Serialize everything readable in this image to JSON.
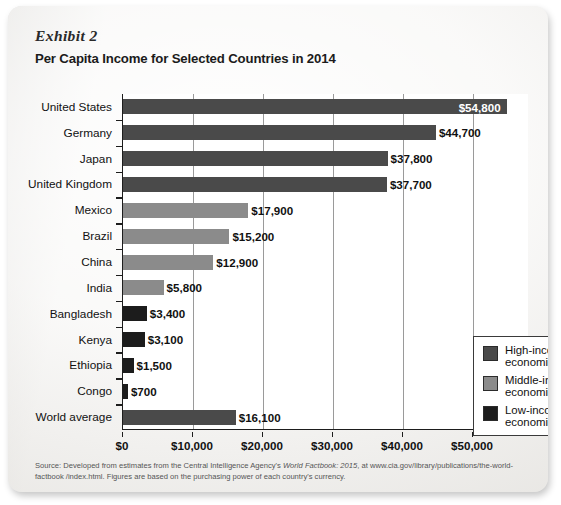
{
  "exhibit_label": "Exhibit 2",
  "title": "Per Capita Income for Selected Countries in 2014",
  "source_note_part1": "Source: Developed from estimates from the Central Intelligence Agency's ",
  "source_note_italic": "World Factbook: 2015",
  "source_note_part2": ", at www.cia.gov/library/publications/the-world-factbook /index.html. Figures are based on the purchasing power of each country's currency.",
  "legend": {
    "items": [
      {
        "label_line1": "High-income",
        "label_line2": "economies",
        "color": "#4a4a4a"
      },
      {
        "label_line1": "Middle-income",
        "label_line2": "economies",
        "color": "#8b8b8b"
      },
      {
        "label_line1": "Low-income",
        "label_line2": "economies",
        "color": "#1c1c1c"
      }
    ]
  },
  "chart_data": {
    "type": "bar",
    "orientation": "horizontal",
    "title": "Per Capita Income for Selected Countries in 2014",
    "xlabel": "",
    "ylabel": "",
    "xlim": [
      0,
      58000
    ],
    "xticks": [
      0,
      10000,
      20000,
      30000,
      40000,
      50000
    ],
    "xtick_labels": [
      "$0",
      "$10,000",
      "$20,000",
      "$30,000",
      "$40,000",
      "$50,000"
    ],
    "grid": true,
    "legend_position": "middle-right inside plot",
    "categories": [
      "United States",
      "Germany",
      "Japan",
      "United Kingdom",
      "Mexico",
      "Brazil",
      "China",
      "India",
      "Bangladesh",
      "Kenya",
      "Ethiopia",
      "Congo",
      "World average"
    ],
    "values": [
      54800,
      44700,
      37800,
      37700,
      17900,
      15200,
      12900,
      5800,
      3400,
      3100,
      1500,
      700,
      16100
    ],
    "value_labels": [
      "$54,800",
      "$44,700",
      "$37,800",
      "$37,700",
      "$17,900",
      "$15,200",
      "$12,900",
      "$5,800",
      "$3,400",
      "$3,100",
      "$1,500",
      "$700",
      "$16,100"
    ],
    "groups": [
      "high",
      "high",
      "high",
      "high",
      "middle",
      "middle",
      "middle",
      "middle",
      "low",
      "low",
      "low",
      "low",
      "high"
    ],
    "group_colors": {
      "high": "#4a4a4a",
      "middle": "#8b8b8b",
      "low": "#1c1c1c"
    },
    "label_inside_bar": [
      true,
      false,
      false,
      false,
      false,
      false,
      false,
      false,
      false,
      false,
      false,
      false,
      false
    ]
  }
}
